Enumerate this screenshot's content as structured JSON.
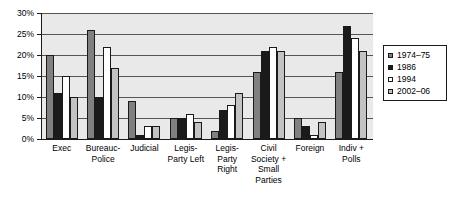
{
  "chart_data": {
    "type": "bar",
    "title": "",
    "xlabel": "",
    "ylabel": "",
    "ylim": [
      0,
      30
    ],
    "grid": true,
    "legend_position": "right",
    "y_ticks": [
      "0%",
      "5%",
      "10%",
      "15%",
      "20%",
      "25%",
      "30%"
    ],
    "y_tick_values": [
      0,
      5,
      10,
      15,
      20,
      25,
      30
    ],
    "categories": [
      "Exec",
      "Bureauc-\nPolice",
      "Judicial",
      "Legis-\nParty Left",
      "Legis-\nParty\nRight",
      "Civil\nSociety +\nSmall\nParties",
      "Foreign",
      "Indiv +\nPolls"
    ],
    "series": [
      {
        "name": "1974–75",
        "color": "#808080",
        "values": [
          20,
          26,
          9,
          5,
          2,
          16,
          5,
          16
        ]
      },
      {
        "name": "1986",
        "color": "#1a1a1a",
        "values": [
          11,
          10,
          1,
          5,
          7,
          21,
          3,
          27
        ]
      },
      {
        "name": "1994",
        "color": "#ffffff",
        "values": [
          15,
          22,
          3,
          6,
          8,
          22,
          1,
          24
        ]
      },
      {
        "name": "2002–06",
        "color": "#c3c3c3",
        "values": [
          10,
          17,
          3,
          4,
          11,
          21,
          4,
          21
        ]
      }
    ]
  },
  "colors": {
    "plot_background": "#e9e9e9",
    "gridline": "#555555",
    "axis": "#1a1a1a",
    "page_background": "#ffffff"
  }
}
